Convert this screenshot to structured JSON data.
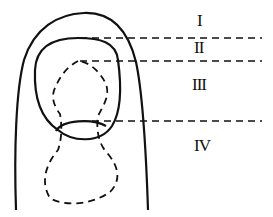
{
  "diagram": {
    "zones": [
      {
        "label": "I"
      },
      {
        "label": "II"
      },
      {
        "label": "III"
      },
      {
        "label": "IV"
      }
    ],
    "colors": {
      "stroke": "#111111",
      "background": "#ffffff"
    }
  }
}
